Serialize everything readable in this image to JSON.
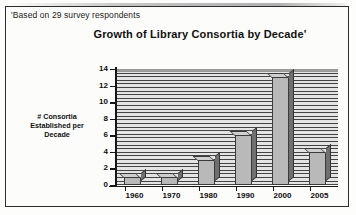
{
  "figure": {
    "footnote": "'Based on 29 survey respondents",
    "title": "Growth of Library Consortia by Decade'",
    "y_caption_line1": "# Consortia",
    "y_caption_line2": "Established per",
    "y_caption_line3": "Decade",
    "frame_color": "#2c2c2c",
    "bar_face_color": "#b9b9b9",
    "bar_side_color": "#6f6f6f",
    "plot_wall_color": "#d8d8d8"
  },
  "chart_data": {
    "type": "bar",
    "title": "Growth of Library Consortia by Decade'",
    "subtitle": "'Based on 29 survey respondents",
    "xlabel": "",
    "ylabel": "# Consortia Established per Decade",
    "categories": [
      "1960",
      "1970",
      "1980",
      "1990",
      "2000",
      "2005"
    ],
    "values": [
      1,
      1,
      3,
      6,
      13,
      4
    ],
    "ylim": [
      0,
      14
    ],
    "ytick_labels": [
      "0",
      "2",
      "4",
      "6",
      "8",
      "10",
      "12",
      "14"
    ],
    "ytick_values": [
      0,
      2,
      4,
      6,
      8,
      10,
      12,
      14
    ],
    "grid": true,
    "legend": "none",
    "style": "3d-bar-grayscale"
  }
}
